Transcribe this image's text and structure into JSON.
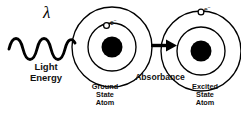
{
  "figure": {
    "type": "diagram",
    "background_color": "#ffffff",
    "stroke_color": "#000000",
    "text_color": "#111111"
  },
  "light": {
    "wavelength_symbol": "λ",
    "label_line1": "Light",
    "label_line2": "Energy",
    "wave_cycles": 4.5,
    "icon": "sine-wave-icon"
  },
  "ground_atom": {
    "label_line1": "Ground",
    "label_line2": "State",
    "label_line3": "Atom",
    "nucleus": "filled-circle",
    "orbits": 2,
    "electron_symbol": "e",
    "electron_charge": "−",
    "electron_orbit": "inner",
    "electron_icon": "open-circle-electron-icon"
  },
  "excited_atom": {
    "label_line1": "Excited",
    "label_line2": "State",
    "label_line3": "Atom",
    "nucleus": "filled-circle",
    "orbits": 2,
    "electron_symbol": "e",
    "electron_charge": "−",
    "electron_orbit": "outer",
    "electron_icon": "open-circle-electron-icon"
  },
  "transition": {
    "label": "Absorbance",
    "arrow_direction": "right",
    "arrow_icon": "arrow-right-icon"
  }
}
